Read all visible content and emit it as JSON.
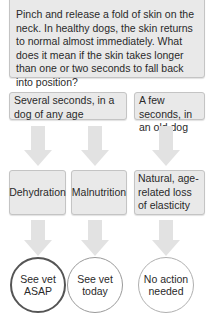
{
  "intro": {
    "text": "Pinch and release a fold of skin on the neck. In healthy dogs, the skin returns to normal almost immediately. What does it mean if the skin takes longer than one or two seconds to fall back into position?"
  },
  "observations": [
    {
      "label": "Several seconds, in a dog of any age"
    },
    {
      "label": "A few seconds, in an old dog"
    }
  ],
  "causes": [
    {
      "label": "Dehydration"
    },
    {
      "label": "Malnutrition"
    },
    {
      "label": "Natural, age-related loss of elasticity"
    }
  ],
  "actions": [
    {
      "label": "See vet ASAP",
      "line1": "See vet",
      "line2": "ASAP"
    },
    {
      "label": "See vet today",
      "line1": "See vet",
      "line2": "today"
    },
    {
      "label": "No action needed",
      "line1": "No action",
      "line2": "needed"
    }
  ],
  "colors": {
    "box_fill": "#e9e9e9",
    "box_border": "#c4c4c4",
    "arrow": "#e2e2e2",
    "urgent_ring": "#555555",
    "soon_ring": "#9a9a9a",
    "none_ring": "#b0b0b0"
  }
}
